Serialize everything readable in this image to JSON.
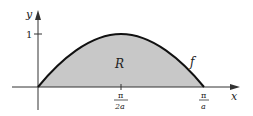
{
  "figure": {
    "type": "function-region-plot",
    "function_label": "f",
    "region_label": "R",
    "x_axis_label": "x",
    "y_axis_label": "y",
    "y_tick_label": "1",
    "x_ticks": [
      {
        "numerator": "π",
        "denominator": "2a"
      },
      {
        "numerator": "π",
        "denominator": "a"
      }
    ],
    "curve": "sin(a x) on [0, π/a]",
    "colors": {
      "fill": "#c8c8c8",
      "curve": "#111111",
      "axis": "#333333"
    }
  }
}
